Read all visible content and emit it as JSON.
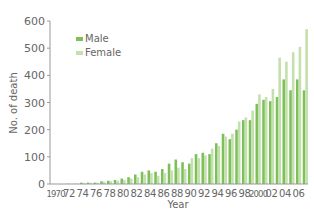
{
  "chart_data": {
    "type": "bar",
    "title": "",
    "xlabel": "Year",
    "ylabel": "No. of death",
    "ylim": [
      0,
      600
    ],
    "yticks": [
      0,
      100,
      200,
      300,
      400,
      500,
      600
    ],
    "grid": false,
    "legend_position": "top-left",
    "xtick_labels": [
      "1970",
      "72",
      "74",
      "76",
      "78",
      "80",
      "82",
      "84",
      "86",
      "88",
      "90",
      "92",
      "94",
      "96",
      "98",
      "2000",
      "02",
      "04",
      "06"
    ],
    "categories": [
      1970,
      1971,
      1972,
      1973,
      1974,
      1975,
      1976,
      1977,
      1978,
      1979,
      1980,
      1981,
      1982,
      1983,
      1984,
      1985,
      1986,
      1987,
      1988,
      1989,
      1990,
      1991,
      1992,
      1993,
      1994,
      1995,
      1996,
      1997,
      1998,
      1999,
      2000,
      2001,
      2002,
      2003,
      2004,
      2005,
      2006,
      2007
    ],
    "series": [
      {
        "name": "Male",
        "color": "#7dc05a",
        "values": [
          0,
          0,
          1,
          1,
          5,
          5,
          5,
          10,
          12,
          15,
          20,
          25,
          35,
          45,
          50,
          45,
          55,
          75,
          90,
          80,
          75,
          110,
          115,
          110,
          150,
          185,
          165,
          200,
          235,
          235,
          295,
          310,
          305,
          320,
          385,
          345,
          385,
          345
        ]
      },
      {
        "name": "Female",
        "color": "#c3e0ad",
        "values": [
          0,
          0,
          1,
          1,
          3,
          4,
          5,
          8,
          10,
          12,
          15,
          20,
          25,
          35,
          40,
          30,
          40,
          50,
          60,
          55,
          95,
          95,
          105,
          130,
          140,
          175,
          185,
          230,
          245,
          270,
          330,
          320,
          350,
          465,
          450,
          485,
          505,
          570
        ]
      }
    ]
  }
}
